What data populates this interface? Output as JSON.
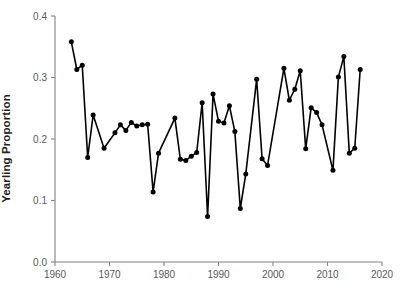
{
  "chart_data": {
    "type": "line",
    "title": "",
    "xlabel": "",
    "ylabel": "Yearling Proportion",
    "xlim": [
      1960,
      2020
    ],
    "ylim": [
      0.0,
      0.4
    ],
    "xticks": [
      1960,
      1970,
      1980,
      1990,
      2000,
      2010,
      2020
    ],
    "xtick_labels": [
      "1960",
      "1970",
      "1980",
      "1990",
      "2000",
      "2010",
      "2020"
    ],
    "yticks": [
      0.0,
      0.1,
      0.2,
      0.3,
      0.4
    ],
    "ytick_labels": [
      "0.0",
      "0.1",
      "0.2",
      "0.3",
      "0.4"
    ],
    "grid": false,
    "legend": false,
    "marker": "filled-circle",
    "line_color": "#000000",
    "marker_color": "#000000",
    "axis_color": "#808285",
    "x": [
      1963,
      1964,
      1965,
      1966,
      1967,
      1969,
      1971,
      1972,
      1973,
      1974,
      1975,
      1976,
      1977,
      1978,
      1979,
      1982,
      1983,
      1984,
      1985,
      1986,
      1987,
      1988,
      1989,
      1990,
      1991,
      1992,
      1993,
      1994,
      1995,
      1997,
      1998,
      1999,
      2002,
      2003,
      2004,
      2005,
      2006,
      2007,
      2008,
      2009,
      2011,
      2012,
      2013,
      2014,
      2015,
      2016
    ],
    "y": [
      0.358,
      0.313,
      0.32,
      0.17,
      0.239,
      0.185,
      0.21,
      0.223,
      0.214,
      0.227,
      0.221,
      0.223,
      0.224,
      0.114,
      0.177,
      0.234,
      0.167,
      0.165,
      0.172,
      0.178,
      0.259,
      0.074,
      0.273,
      0.229,
      0.226,
      0.254,
      0.212,
      0.087,
      0.143,
      0.297,
      0.168,
      0.157,
      0.315,
      0.263,
      0.281,
      0.311,
      0.184,
      0.251,
      0.243,
      0.223,
      0.149,
      0.301,
      0.334,
      0.177,
      0.185,
      0.313
    ],
    "series": [
      {
        "name": "Yearling Proportion",
        "x": [
          1963,
          1964,
          1965,
          1966,
          1967,
          1969,
          1971,
          1972,
          1973,
          1974,
          1975,
          1976,
          1977,
          1978,
          1979,
          1982,
          1983,
          1984,
          1985,
          1986,
          1987,
          1988,
          1989,
          1990,
          1991,
          1992,
          1993,
          1994,
          1995,
          1997,
          1998,
          1999,
          2002,
          2003,
          2004,
          2005,
          2006,
          2007,
          2008,
          2009,
          2011,
          2012,
          2013,
          2014,
          2015,
          2016
        ],
        "values": [
          0.358,
          0.313,
          0.32,
          0.17,
          0.239,
          0.185,
          0.21,
          0.223,
          0.214,
          0.227,
          0.221,
          0.223,
          0.224,
          0.114,
          0.177,
          0.234,
          0.167,
          0.165,
          0.172,
          0.178,
          0.259,
          0.074,
          0.273,
          0.229,
          0.226,
          0.254,
          0.212,
          0.087,
          0.143,
          0.297,
          0.168,
          0.157,
          0.315,
          0.263,
          0.281,
          0.311,
          0.184,
          0.251,
          0.243,
          0.223,
          0.149,
          0.301,
          0.334,
          0.177,
          0.185,
          0.313
        ]
      }
    ]
  }
}
